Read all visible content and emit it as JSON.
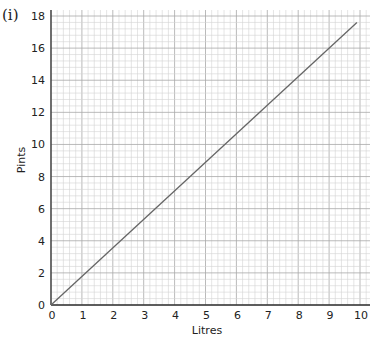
{
  "question_label": "(i)",
  "chart_data": {
    "type": "line",
    "title": "",
    "xlabel": "Litres",
    "ylabel": "Pints",
    "xlim": [
      0,
      10
    ],
    "ylim": [
      0,
      18
    ],
    "x_ticks": [
      "0",
      "1",
      "2",
      "3",
      "4",
      "5",
      "6",
      "7",
      "8",
      "9",
      "10"
    ],
    "y_ticks": [
      "0",
      "2",
      "4",
      "6",
      "8",
      "10",
      "12",
      "14",
      "16",
      "18"
    ],
    "grid": true,
    "legend": null,
    "series": [
      {
        "name": "Litres to Pints",
        "x": [
          0,
          9.9
        ],
        "y": [
          0,
          17.6
        ],
        "color": "#666666"
      }
    ]
  }
}
